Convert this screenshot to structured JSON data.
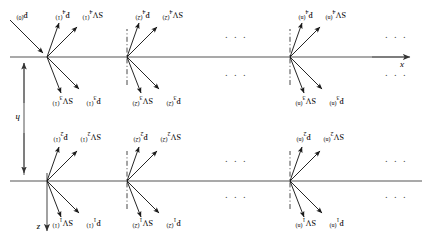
{
  "figure": {
    "orientation_note": "printed upside-down",
    "axes": {
      "x_label": "x",
      "z_label": "z",
      "thickness_label": "h"
    },
    "colors": {
      "line": "#555555",
      "ray": "#1a1a1a",
      "dashdot": "#333333",
      "text": "#111111"
    },
    "ellipsis": "· · ·",
    "interfaces": [
      {
        "name": "upper-interface",
        "y": 62
      },
      {
        "name": "lower-interface",
        "y": 186
      }
    ],
    "nodes": [
      {
        "name": "upper-node-n",
        "x": 142,
        "y": 62
      },
      {
        "name": "upper-node-2",
        "x": 305,
        "y": 62
      },
      {
        "name": "upper-node-1",
        "x": 385,
        "y": 62
      },
      {
        "name": "lower-node-n",
        "x": 142,
        "y": 186
      },
      {
        "name": "lower-node-2",
        "x": 305,
        "y": 186
      },
      {
        "name": "lower-node-1",
        "x": 385,
        "y": 186
      }
    ],
    "labels": {
      "upper_above": [
        {
          "p": "P",
          "p_sub": "1",
          "p_sup": "(n)",
          "s": "SV",
          "s_sub": "1",
          "s_sup": "(n)"
        },
        {
          "p": "P",
          "p_sub": "1",
          "p_sup": "(2)",
          "s": "SV",
          "s_sub": "1",
          "s_sup": "(2)"
        },
        {
          "p": "P",
          "p_sub": "1",
          "p_sup": "(1)",
          "s": "SV",
          "s_sub": "1",
          "s_sup": "(1)"
        }
      ],
      "upper_below": [
        {
          "p": "P",
          "p_sub": "2",
          "p_sup": "(n)",
          "s": "SV",
          "s_sub": "2",
          "s_sup": "(n)"
        },
        {
          "p": "P",
          "p_sub": "2",
          "p_sup": "(2)",
          "s": "SV",
          "s_sub": "2",
          "s_sup": "(2)"
        },
        {
          "p": "P",
          "p_sub": "2",
          "p_sup": "(1)",
          "s": "SV",
          "s_sub": "2",
          "s_sup": "(1)"
        }
      ],
      "lower_above": [
        {
          "p": "P",
          "p_sub": "3",
          "p_sup": "(n)",
          "s": "SV",
          "s_sub": "3",
          "s_sup": "(n)"
        },
        {
          "p": "P",
          "p_sub": "3",
          "p_sup": "(2)",
          "s": "SV",
          "s_sub": "3",
          "s_sup": "(2)"
        },
        {
          "p": "P",
          "p_sub": "3",
          "p_sup": "(1)",
          "s": "SV",
          "s_sub": "3",
          "s_sup": "(1)"
        }
      ],
      "lower_below": [
        {
          "p": "P",
          "p_sub": "4",
          "p_sup": "(n)",
          "s": "SV",
          "s_sub": "4",
          "s_sup": "(n)"
        },
        {
          "p": "P",
          "p_sub": "4",
          "p_sup": "(2)",
          "s": "SV",
          "s_sub": "4",
          "s_sup": "(2)"
        },
        {
          "p": "P",
          "p_sub": "4",
          "p_sup": "(1)",
          "s": "SV",
          "s_sub": "4",
          "s_sup": "(1)"
        }
      ],
      "incident": {
        "p": "P",
        "p_sub": "",
        "p_sup": "(0)"
      }
    }
  }
}
